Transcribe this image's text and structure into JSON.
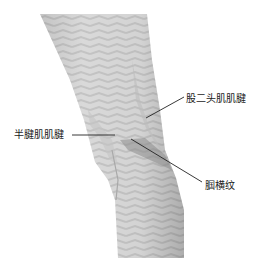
{
  "figure": {
    "colors": {
      "background": "#ffffff",
      "skin_light": "#e6e6e6",
      "skin_mid": "#cfcfcf",
      "skin_dark": "#9a9a9a",
      "leader_line": "#222222",
      "label_text": "#1a1a1a"
    }
  },
  "labels": {
    "biceps_femoris_tendon": "股二头肌肌腱",
    "semitendinosus_tendon": "半腱肌肌腱",
    "popliteal_crease": "腘横纹"
  }
}
